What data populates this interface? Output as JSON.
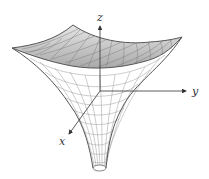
{
  "figure": {
    "axes": {
      "x_label": "x",
      "y_label": "y",
      "z_label": "z"
    },
    "colors": {
      "line": "#555555",
      "mesh": "#8a8a8a",
      "shade": "#bdbdbd",
      "axis": "#333333"
    }
  }
}
